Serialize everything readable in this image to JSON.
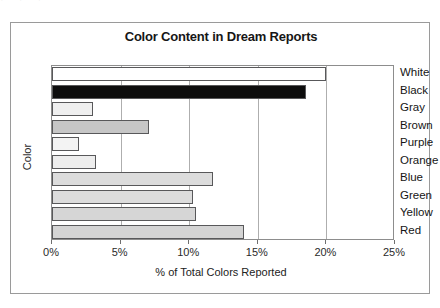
{
  "chart_data": {
    "type": "bar",
    "orientation": "horizontal",
    "title": "Color Content in Dream Reports",
    "xlabel": "% of Total Colors Reported",
    "ylabel": "Color",
    "categories": [
      "White",
      "Black",
      "Gray",
      "Brown",
      "Purple",
      "Orange",
      "Blue",
      "Green",
      "Yellow",
      "Red"
    ],
    "values": [
      20.0,
      18.5,
      3.0,
      7.1,
      2.0,
      3.2,
      11.7,
      10.3,
      10.5,
      14.0
    ],
    "bar_colors": [
      "#ffffff",
      "#0d0d0d",
      "#efefef",
      "#c6c6c6",
      "#f3f3f3",
      "#ededed",
      "#dcdcdc",
      "#dcdcdc",
      "#d6d6d6",
      "#d4d4d4"
    ],
    "xlim": [
      0,
      25
    ],
    "xtick_values": [
      0,
      5,
      10,
      15,
      20,
      25
    ],
    "xtick_labels": [
      "0%",
      "5%",
      "10%",
      "15%",
      "20%",
      "25%"
    ],
    "grid": true,
    "grid_axis": "x",
    "legend": false,
    "category_labels_position": "right-of-plot",
    "axis_line_color": "#8d8d8d",
    "grid_color": "#aeaeae",
    "bar_border_color": "#58585a"
  },
  "frame": {
    "border_color": "#9a9a9a",
    "background": "#ffffff"
  },
  "top_sliver": {
    "text": "· · ·"
  }
}
